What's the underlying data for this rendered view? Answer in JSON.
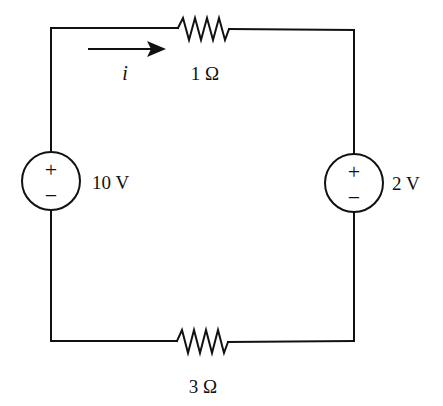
{
  "diagram": {
    "type": "circuit-schematic",
    "colors": {
      "line": "#111111",
      "background": "#ffffff"
    },
    "current": {
      "label": "i",
      "direction": "right"
    },
    "resistors": [
      {
        "id": "R1",
        "position": "top",
        "label": "1 Ω"
      },
      {
        "id": "R2",
        "position": "bottom",
        "label": "3 Ω"
      }
    ],
    "sources": [
      {
        "id": "V1",
        "position": "left",
        "label": "10 V",
        "plus": "+",
        "minus": "−"
      },
      {
        "id": "V2",
        "position": "right",
        "label": "2 V",
        "plus": "+",
        "minus": "−"
      }
    ]
  }
}
